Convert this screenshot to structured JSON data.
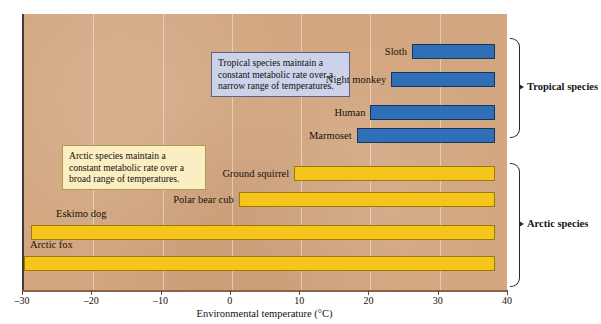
{
  "chart_data": {
    "type": "bar",
    "title": "",
    "xlabel": "Environmental temperature (°C)",
    "ylabel": "",
    "xlim": [
      -30,
      40
    ],
    "orientation": "horizontal",
    "grid": true,
    "legend_position": "right",
    "tick_labels": [
      "–30",
      "–20",
      "–10",
      "0",
      "10",
      "20",
      "30",
      "40"
    ],
    "tick_values": [
      -30,
      -20,
      -10,
      0,
      10,
      20,
      30,
      40
    ],
    "groups": [
      {
        "name": "Tropical species",
        "color": "#2e6fb7",
        "bars": [
          {
            "label": "Sloth",
            "start": 26,
            "end": 38
          },
          {
            "label": "Night monkey",
            "start": 23,
            "end": 38
          },
          {
            "label": "Human",
            "start": 20,
            "end": 38
          },
          {
            "label": "Marmoset",
            "start": 18,
            "end": 38
          }
        ]
      },
      {
        "name": "Arctic species",
        "color": "#f6c51c",
        "bars": [
          {
            "label": "Ground squirrel",
            "start": 9,
            "end": 38
          },
          {
            "label": "Polar bear cub",
            "start": 1,
            "end": 38
          },
          {
            "label": "Eskimo dog",
            "start": -29,
            "end": 38
          },
          {
            "label": "Arctic fox",
            "start": -30,
            "end": 38
          }
        ]
      }
    ],
    "annotations": [
      {
        "id": "tropical-callout",
        "text": "Tropical species maintain a constant metabolic rate over a narrow range of temperatures.",
        "background": "#ccd2ea",
        "border": "#5b6287"
      },
      {
        "id": "arctic-callout",
        "text": "Arctic species maintain a constant metabolic rate over a broad range of temperatures.",
        "background": "#faeec2",
        "border": "#b09a4e"
      }
    ],
    "plot_background": "#d2a680"
  },
  "labels": {
    "sloth": "Sloth",
    "night_monkey": "Night monkey",
    "human": "Human",
    "marmoset": "Marmoset",
    "ground_squirrel": "Ground squirrel",
    "polar_bear_cub": "Polar bear cub",
    "eskimo_dog": "Eskimo dog",
    "arctic_fox": "Arctic fox"
  },
  "groups": {
    "tropical": "Tropical species",
    "arctic": "Arctic species"
  },
  "callouts": {
    "tropical": "Tropical species maintain a constant metabolic rate over a narrow range of temperatures.",
    "arctic": "Arctic species maintain a constant metabolic rate over a broad range of temperatures."
  },
  "axis": {
    "title": "Environmental temperature (°C)",
    "ticks": [
      "–30",
      "–20",
      "–10",
      "0",
      "10",
      "20",
      "30",
      "40"
    ]
  }
}
